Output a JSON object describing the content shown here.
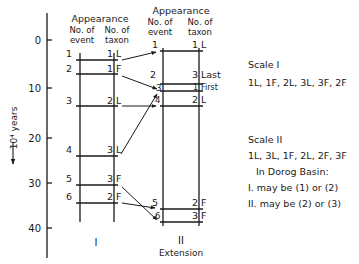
{
  "axis": {
    "label": "10⁴ years",
    "ticks": [
      {
        "label": "0",
        "value": 0
      },
      {
        "label": "10",
        "value": 10
      },
      {
        "label": "20",
        "value": 20
      },
      {
        "label": "30",
        "value": 30
      },
      {
        "label": "40",
        "value": 40
      }
    ]
  },
  "columns": {
    "I": {
      "heading": "Appearance",
      "event_header": "No. of event",
      "taxon_header": "No. of taxon",
      "footer": "I",
      "rows": [
        {
          "event": "1",
          "taxon": "1",
          "type": "L"
        },
        {
          "event": "2",
          "taxon": "1",
          "type": "F"
        },
        {
          "event": "3",
          "taxon": "2",
          "type": "L"
        },
        {
          "event": "4",
          "taxon": "3",
          "type": "L"
        },
        {
          "event": "5",
          "taxon": "3",
          "type": "F"
        },
        {
          "event": "6",
          "taxon": "2",
          "type": "F"
        }
      ]
    },
    "II": {
      "heading": "Appearance",
      "event_header": "No. of event",
      "taxon_header": "No. of taxon",
      "footer": "II",
      "footer_sub": "Extension",
      "rows": [
        {
          "event": "1",
          "taxon": "1",
          "type": "L"
        },
        {
          "event": "2",
          "taxon": "3",
          "type": "Last"
        },
        {
          "event": "3",
          "taxon": "1",
          "type": "First"
        },
        {
          "event": "4",
          "taxon": "2",
          "type": "L"
        },
        {
          "event": "5",
          "taxon": "2",
          "type": "F"
        },
        {
          "event": "6",
          "taxon": "3",
          "type": "F"
        }
      ]
    }
  },
  "notes": {
    "scale1_title": "Scale I",
    "scale1_seq": "1L, 1F, 2L, 3L, 3F, 2F",
    "scale2_title": "Scale II",
    "scale2_seq": "1L, 3L, 1F, 2L, 2F, 3F",
    "basin": "In Dorog Basin:",
    "line1": "I. may be (1) or (2)",
    "line2": "II. may be (2) or (3)"
  }
}
